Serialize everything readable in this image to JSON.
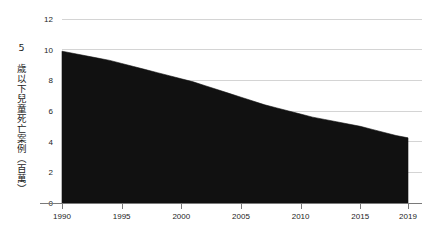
{
  "chart_data": {
    "type": "area",
    "title": "",
    "subtitle": "",
    "xlabel": "",
    "ylabel": "5 歲以下兒童死亡案例（百萬）",
    "xlim": [
      1990,
      2019
    ],
    "ylim": [
      0,
      12
    ],
    "grid": true,
    "legend": false,
    "legend_position": "none",
    "series_color": "#111111",
    "grid_color": "#d4d4d4",
    "axis_color": "#7a7a7a",
    "background_color": "#ffffff",
    "x_tick_labels": [
      "1990",
      "1995",
      "2000",
      "2005",
      "2010",
      "2015",
      "2019"
    ],
    "x_ticks": [
      1990,
      1995,
      2000,
      2005,
      2010,
      2015,
      2019
    ],
    "y_tick_labels": [
      "0",
      "2",
      "4",
      "6",
      "8",
      "10",
      "12"
    ],
    "y_ticks": [
      0,
      2,
      4,
      6,
      8,
      10,
      12
    ],
    "series": [
      {
        "name": "5 歲以下兒童死亡案例（百萬）",
        "x": [
          1990,
          1991,
          1992,
          1993,
          1994,
          1995,
          1996,
          1997,
          1998,
          1999,
          2000,
          2001,
          2002,
          2003,
          2004,
          2005,
          2006,
          2007,
          2008,
          2009,
          2010,
          2011,
          2012,
          2013,
          2014,
          2015,
          2016,
          2017,
          2018,
          2019
        ],
        "values": [
          9.9,
          9.75,
          9.6,
          9.45,
          9.3,
          9.1,
          8.9,
          8.7,
          8.5,
          8.3,
          8.1,
          7.9,
          7.65,
          7.4,
          7.15,
          6.9,
          6.65,
          6.4,
          6.2,
          6.0,
          5.8,
          5.6,
          5.45,
          5.3,
          5.15,
          5.0,
          4.8,
          4.6,
          4.4,
          4.25
        ]
      }
    ]
  },
  "axis": {
    "y_title": "5 歲以下兒童死亡案例（百萬）"
  }
}
